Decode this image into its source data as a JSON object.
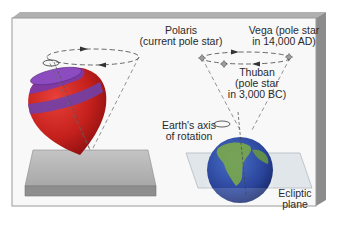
{
  "diagram": {
    "labels": {
      "polaris_line1": "Polaris",
      "polaris_line2": "(current pole star)",
      "vega_line1": "Vega (pole star",
      "vega_line2": "in 14,000 AD)",
      "thuban_line1": "Thuban",
      "thuban_line2": "(pole star",
      "thuban_line3": "in 3,000 BC)",
      "axis_line1": "Earth's axis",
      "axis_line2": "of rotation",
      "ecliptic_line1": "Ecliptic",
      "ecliptic_line2": "plane"
    },
    "elements": [
      "spinning-top",
      "base-slab",
      "precession-cone-top",
      "earth-globe",
      "ecliptic-plane",
      "precession-cone-earth",
      "star-polaris",
      "star-vega",
      "star-thuban"
    ],
    "colors": {
      "panel_face": "#f7f7f7",
      "panel_edge": "#9a9a9a",
      "top_red": "#c8201e",
      "top_purple": "#7a3aa8",
      "slab": "#b4b4b4",
      "ocean": "#2f4fa0",
      "land": "#7aa84a"
    }
  }
}
